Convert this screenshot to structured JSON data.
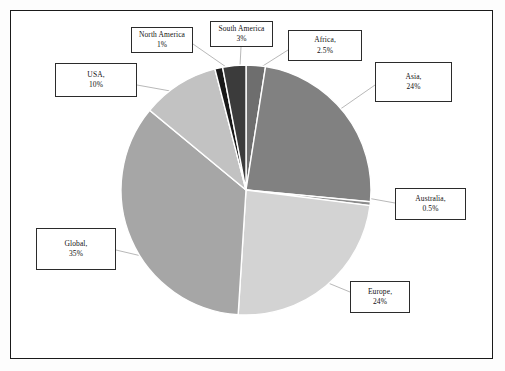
{
  "figure": {
    "background_color": "#ffffff",
    "border_color": "#1a1a1a"
  },
  "chart_data": {
    "type": "pie",
    "title": "",
    "subtitle": "",
    "xlabel": "",
    "ylabel": "",
    "legend_position": "callout-labels",
    "grid": false,
    "start_angle_deg": 0,
    "direction": "clockwise",
    "categories": [
      "Africa",
      "Asia",
      "Australia",
      "Europe",
      "Global",
      "USA",
      "North America",
      "South America"
    ],
    "values": [
      2.5,
      24,
      0.5,
      24,
      35,
      10,
      1,
      3
    ],
    "unit": "%",
    "slices": [
      {
        "name": "Africa",
        "label_name": "Africa,",
        "label_value": "2.5%",
        "value": 2.5,
        "color": "#6e6e6e"
      },
      {
        "name": "Asia",
        "label_name": "Asia,",
        "label_value": "24%",
        "value": 24,
        "color": "#818181"
      },
      {
        "name": "Australia",
        "label_name": "Australia,",
        "label_value": "0.5%",
        "value": 0.5,
        "color": "#8c8c8c"
      },
      {
        "name": "Europe",
        "label_name": "Europe,",
        "label_value": "24%",
        "value": 24,
        "color": "#d3d3d3"
      },
      {
        "name": "Global",
        "label_name": "Global,",
        "label_value": "35%",
        "value": 35,
        "color": "#a6a6a6"
      },
      {
        "name": "USA",
        "label_name": "USA,",
        "label_value": "10%",
        "value": 10,
        "color": "#c2c2c2"
      },
      {
        "name": "North America",
        "label_name": "North America",
        "label_value": "1%",
        "value": 1,
        "color": "#191919"
      },
      {
        "name": "South America",
        "label_name": "South America",
        "label_value": "3%",
        "value": 3,
        "color": "#3b3b3b"
      }
    ]
  }
}
